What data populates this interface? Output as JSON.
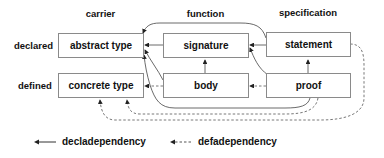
{
  "diagram": {
    "columns": [
      {
        "id": "carrier",
        "label": "carrier"
      },
      {
        "id": "function",
        "label": "function"
      },
      {
        "id": "specification",
        "label": "specification"
      }
    ],
    "rows": [
      {
        "id": "declared",
        "label": "declared"
      },
      {
        "id": "defined",
        "label": "defined"
      }
    ],
    "nodes": {
      "abstract_type": "abstract type",
      "signature": "signature",
      "statement": "statement",
      "concrete_type": "concrete type",
      "body": "body",
      "proof": "proof"
    },
    "edges": [
      {
        "from": "signature",
        "to": "abstract_type",
        "kind": "decl"
      },
      {
        "from": "statement",
        "to": "signature",
        "kind": "decl"
      },
      {
        "from": "statement",
        "to": "abstract_type",
        "kind": "decl"
      },
      {
        "from": "body",
        "to": "signature",
        "kind": "decl"
      },
      {
        "from": "body",
        "to": "abstract_type",
        "kind": "decl"
      },
      {
        "from": "proof",
        "to": "statement",
        "kind": "decl"
      },
      {
        "from": "proof",
        "to": "signature",
        "kind": "decl"
      },
      {
        "from": "proof",
        "to": "abstract_type",
        "kind": "decl"
      },
      {
        "from": "body",
        "to": "concrete_type",
        "kind": "def"
      },
      {
        "from": "proof",
        "to": "body",
        "kind": "def"
      },
      {
        "from": "proof",
        "to": "concrete_type",
        "kind": "def"
      },
      {
        "from": "statement",
        "to": "concrete_type",
        "kind": "def"
      }
    ],
    "legend": {
      "decl_label": "decladependency",
      "def_label": "defadependency"
    },
    "colors": {
      "box_border": "#8a8a8a",
      "edge": "#333333",
      "text": "#111111"
    }
  }
}
